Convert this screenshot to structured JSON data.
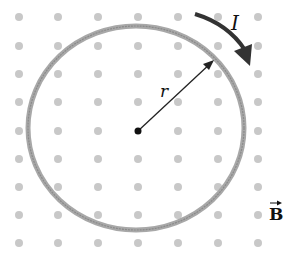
{
  "diagram": {
    "current_label": "I",
    "radius_label": "r",
    "field_label": "B",
    "field_direction": "out-of-page (dots)",
    "colors": {
      "dot": "#c8c8c8",
      "loop": "#9a9a9a",
      "arrow": "#2a2a2a",
      "text": "#111111"
    },
    "dot_grid": {
      "columns_x": [
        19,
        58,
        98,
        138,
        178,
        218,
        258
      ],
      "rows_y": [
        17,
        46,
        74,
        102,
        131,
        159,
        187,
        215,
        243
      ]
    }
  }
}
